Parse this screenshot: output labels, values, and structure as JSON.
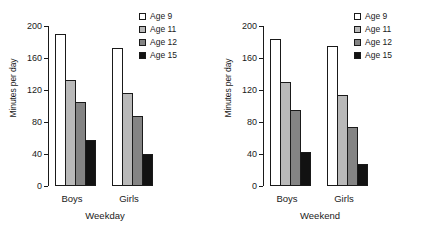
{
  "chart_data": [
    {
      "type": "bar",
      "title": "",
      "xlabel": "Weekday",
      "ylabel": "Minutes per day",
      "categories": [
        "Boys",
        "Girls"
      ],
      "series": [
        {
          "name": "Age 9",
          "values": [
            190,
            173
          ],
          "color": "#ffffff"
        },
        {
          "name": "Age 11",
          "values": [
            133,
            116
          ],
          "color": "#b9b9b9"
        },
        {
          "name": "Age 12",
          "values": [
            105,
            88
          ],
          "color": "#848484"
        },
        {
          "name": "Age 15",
          "values": [
            58,
            40
          ],
          "color": "#121212"
        }
      ],
      "ylim": [
        0,
        200
      ],
      "yticks": [
        0,
        40,
        80,
        120,
        160,
        200
      ],
      "grid": false,
      "legend_position": "top-right"
    },
    {
      "type": "bar",
      "title": "",
      "xlabel": "Weekend",
      "ylabel": "Minutes per day",
      "categories": [
        "Boys",
        "Girls"
      ],
      "series": [
        {
          "name": "Age 9",
          "values": [
            184,
            175
          ],
          "color": "#ffffff"
        },
        {
          "name": "Age 11",
          "values": [
            130,
            114
          ],
          "color": "#b9b9b9"
        },
        {
          "name": "Age 12",
          "values": [
            95,
            74
          ],
          "color": "#848484"
        },
        {
          "name": "Age 15",
          "values": [
            43,
            27
          ],
          "color": "#121212"
        }
      ],
      "ylim": [
        0,
        200
      ],
      "yticks": [
        0,
        40,
        80,
        120,
        160,
        200
      ],
      "grid": false,
      "legend_position": "top-right"
    }
  ],
  "panels": [
    {
      "ylabel": "Minutes per day",
      "xlabel": "Weekday",
      "yticks": [
        "200",
        "160",
        "120",
        "80",
        "40",
        "0"
      ],
      "categories": [
        "Boys",
        "Girls"
      ],
      "legend": [
        "Age 9",
        "Age 11",
        "Age 12",
        "Age 15"
      ]
    },
    {
      "ylabel": "Minutes per day",
      "xlabel": "Weekend",
      "yticks": [
        "200",
        "160",
        "120",
        "80",
        "40",
        "0"
      ],
      "categories": [
        "Boys",
        "Girls"
      ],
      "legend": [
        "Age 9",
        "Age 11",
        "Age 12",
        "Age 15"
      ]
    }
  ]
}
